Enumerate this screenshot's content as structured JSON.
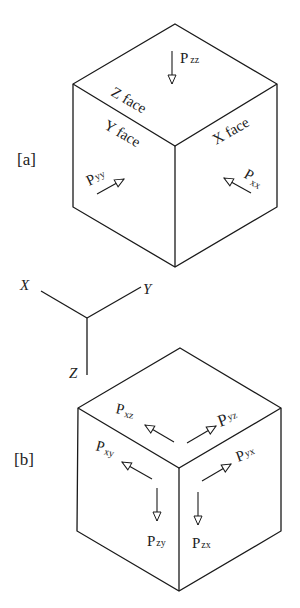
{
  "panel_a": {
    "tag": "[a]",
    "faces": {
      "z": "Z face",
      "y": "Y face",
      "x": "X face"
    },
    "forces": {
      "zz": {
        "main": "P",
        "sub": "zz"
      },
      "yy": {
        "main": "P",
        "sub": "yy"
      },
      "xx": {
        "main": "P",
        "sub": "xx"
      }
    }
  },
  "axes": {
    "x": "X",
    "y": "Y",
    "z": "Z"
  },
  "panel_b": {
    "tag": "[b]",
    "forces": {
      "xz": {
        "main": "P",
        "sub": "xz"
      },
      "yz": {
        "main": "P",
        "sub": "yz"
      },
      "xy": {
        "main": "P",
        "sub": "xy"
      },
      "yx": {
        "main": "P",
        "sub": "yx"
      },
      "zy": {
        "main": "P",
        "sub": "zy"
      },
      "zx": {
        "main": "P",
        "sub": "zx"
      }
    }
  },
  "colors": {
    "line": "#1a1a1a",
    "background": "#ffffff"
  }
}
